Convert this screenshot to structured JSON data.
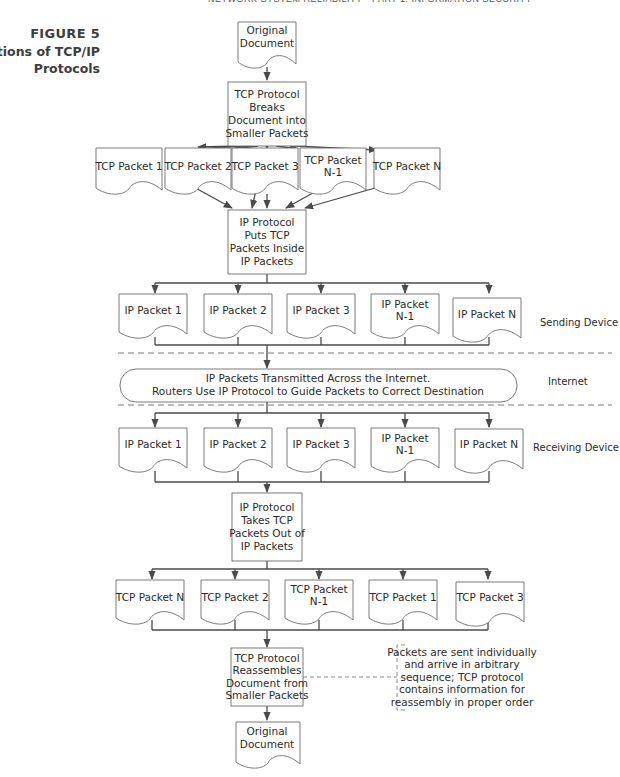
{
  "running_head": "NETWORK SYSTEM RELIABILITY • PART 1: INFORMATION SECURITY",
  "figure": {
    "number": "FIGURE 5",
    "title": "Functions of TCP/IP Protocols"
  },
  "nodes": {
    "original_doc_top": [
      "Original",
      "Document"
    ],
    "tcp_break": [
      "TCP Protocol",
      "Breaks",
      "Document into",
      "Smaller Packets"
    ],
    "tcp_packets_send": [
      [
        "TCP Packet 1"
      ],
      [
        "TCP Packet 2"
      ],
      [
        "TCP Packet 3"
      ],
      [
        "TCP Packet",
        "N-1"
      ],
      [
        "TCP Packet N"
      ]
    ],
    "ip_put": [
      "IP Protocol",
      "Puts TCP",
      "Packets Inside",
      "IP Packets"
    ],
    "ip_packets_send": [
      [
        "IP Packet 1"
      ],
      [
        "IP Packet 2"
      ],
      [
        "IP Packet 3"
      ],
      [
        "IP Packet",
        "N-1"
      ],
      [
        "IP Packet N"
      ]
    ],
    "internet": [
      "IP Packets Transmitted Across the Internet.",
      "Routers Use IP Protocol to Guide Packets to Correct Destination"
    ],
    "ip_packets_recv": [
      [
        "IP Packet 1"
      ],
      [
        "IP Packet 2"
      ],
      [
        "IP Packet 3"
      ],
      [
        "IP Packet",
        "N-1"
      ],
      [
        "IP Packet N"
      ]
    ],
    "ip_take": [
      "IP Protocol",
      "Takes TCP",
      "Packets Out of",
      "IP Packets"
    ],
    "tcp_packets_recv": [
      [
        "TCP Packet N"
      ],
      [
        "TCP Packet 2"
      ],
      [
        "TCP Packet",
        "N-1"
      ],
      [
        "TCP Packet 1"
      ],
      [
        "TCP Packet 3"
      ]
    ],
    "tcp_reassemble": [
      "TCP Protocol",
      "Reassembles",
      "Document from",
      "Smaller Packets"
    ],
    "original_doc_bottom": [
      "Original",
      "Document"
    ]
  },
  "side_labels": {
    "sending": "Sending Device",
    "internet": "Internet",
    "receiving": "Receiving Device"
  },
  "annotation": [
    "Packets are sent individually",
    "and arrive in arbitrary",
    "sequence; TCP protocol",
    "contains information for",
    "reassembly in proper order"
  ]
}
